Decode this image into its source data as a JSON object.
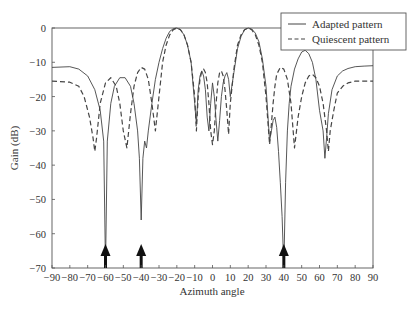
{
  "chart_data": {
    "type": "line",
    "title": "",
    "xlabel": "Azimuth angle",
    "ylabel": "Gain (dB)",
    "xlim": [
      -90,
      90
    ],
    "ylim": [
      -70,
      0
    ],
    "xticks": [
      -90,
      -80,
      -70,
      -60,
      -50,
      -40,
      -30,
      -20,
      -10,
      0,
      10,
      20,
      30,
      40,
      50,
      60,
      70,
      80,
      90
    ],
    "yticks": [
      0,
      -10,
      -20,
      -30,
      -40,
      -50,
      -60,
      -70
    ],
    "grid": false,
    "legend_position": "upper right",
    "series": [
      {
        "name": "Adapted pattern",
        "style": "solid",
        "x": [
          -90,
          -80,
          -75,
          -70,
          -66,
          -63,
          -61,
          -60,
          -59,
          -57,
          -55,
          -52,
          -49,
          -46,
          -44,
          -42,
          -41,
          -40,
          -39,
          -38,
          -37,
          -36,
          -34,
          -32,
          -30,
          -28,
          -26,
          -24,
          -22,
          -20,
          -18,
          -16,
          -14,
          -12,
          -10,
          -9,
          -8,
          -7,
          -6,
          -5,
          -4,
          -3,
          -2,
          -1,
          0,
          1,
          2,
          3,
          4,
          5,
          6,
          7,
          8,
          9,
          10,
          12,
          14,
          16,
          18,
          20,
          22,
          24,
          26,
          28,
          30,
          31,
          32,
          33,
          34,
          35,
          36,
          37,
          38,
          39,
          40,
          41,
          42,
          43,
          44,
          46,
          48,
          50,
          52,
          54,
          56,
          58,
          60,
          62,
          63,
          64,
          65,
          67,
          70,
          73,
          76,
          80,
          85,
          90
        ],
        "values": [
          -11.5,
          -11.3,
          -12,
          -14,
          -18,
          -24,
          -33,
          -70,
          -33,
          -22,
          -17,
          -14.5,
          -14.5,
          -17,
          -22,
          -30,
          -38,
          -56,
          -38,
          -33,
          -35,
          -30,
          -22,
          -15,
          -10,
          -6,
          -3,
          -1,
          -0.2,
          0,
          -0.5,
          -2,
          -5,
          -10,
          -22,
          -28,
          -18,
          -14,
          -12.5,
          -14,
          -18,
          -26,
          -30,
          -22,
          -16,
          -20,
          -27,
          -33,
          -27,
          -20,
          -16,
          -14,
          -13,
          -15,
          -20,
          -13,
          -6,
          -2.5,
          -0.5,
          0,
          -0.3,
          -1.5,
          -4,
          -9,
          -17,
          -25,
          -33,
          -30,
          -27,
          -26,
          -29,
          -36,
          -45,
          -55,
          -70,
          -45,
          -30,
          -22,
          -17,
          -12,
          -9,
          -7,
          -6.5,
          -7.5,
          -10,
          -15,
          -24,
          -30,
          -38,
          -32,
          -25,
          -18,
          -14,
          -12.5,
          -11.8,
          -11.3,
          -11.1,
          -11
        ]
      },
      {
        "name": "Quiescent pattern",
        "style": "dashed",
        "x": [
          -90,
          -80,
          -75,
          -72,
          -69,
          -67,
          -66,
          -65,
          -63,
          -60,
          -57,
          -54,
          -52,
          -50,
          -48,
          -46,
          -44,
          -42,
          -40,
          -38,
          -36,
          -34,
          -32,
          -30,
          -28,
          -26,
          -24,
          -22,
          -20,
          -18,
          -16,
          -14,
          -12,
          -10,
          -9,
          -8,
          -7,
          -6,
          -5,
          -4,
          -3,
          -2,
          -1,
          0,
          1,
          2,
          3,
          4,
          5,
          6,
          7,
          8,
          9,
          10,
          12,
          14,
          16,
          18,
          20,
          22,
          24,
          26,
          28,
          30,
          32,
          33,
          34,
          35,
          36,
          38,
          40,
          42,
          44,
          46,
          48,
          50,
          52,
          54,
          56,
          58,
          60,
          62,
          64,
          65,
          66,
          68,
          70,
          73,
          76,
          80,
          85,
          90
        ],
        "values": [
          -15.5,
          -15.8,
          -17,
          -20,
          -26,
          -32,
          -36,
          -32,
          -22,
          -16,
          -14.5,
          -17,
          -22,
          -30,
          -35,
          -25,
          -17,
          -13,
          -11.5,
          -12,
          -15,
          -22,
          -30,
          -20,
          -10,
          -5,
          -2,
          -0.5,
          0,
          -0.5,
          -2,
          -5,
          -10,
          -20,
          -30,
          -20,
          -15,
          -12.5,
          -12,
          -13,
          -16,
          -22,
          -30,
          -34,
          -30,
          -22,
          -16,
          -13,
          -12.5,
          -14,
          -18,
          -24,
          -31,
          -22,
          -12,
          -5,
          -2,
          -0.5,
          0,
          -0.5,
          -2,
          -5,
          -10,
          -20,
          -34,
          -28,
          -22,
          -17,
          -13.5,
          -11.5,
          -12,
          -15,
          -22,
          -35,
          -26,
          -20,
          -16,
          -14,
          -13.5,
          -14.5,
          -17,
          -22,
          -30,
          -36,
          -30,
          -24,
          -19,
          -17,
          -16,
          -15.5,
          -15.5,
          -15.5
        ]
      }
    ],
    "annotations": [
      {
        "type": "arrow",
        "x": -60,
        "label": "jammer"
      },
      {
        "type": "arrow",
        "x": -40,
        "label": "jammer"
      },
      {
        "type": "arrow",
        "x": 40,
        "label": "jammer"
      }
    ]
  },
  "legend": {
    "items": [
      {
        "label": "Adapted pattern",
        "style": "solid"
      },
      {
        "label": "Quiescent pattern",
        "style": "dashed"
      }
    ]
  },
  "axes": {
    "xlabel": "Azimuth angle",
    "ylabel": "Gain (dB)"
  }
}
